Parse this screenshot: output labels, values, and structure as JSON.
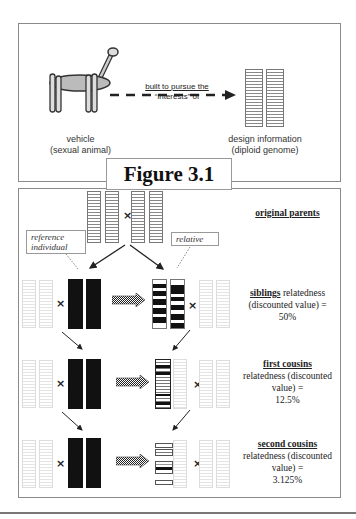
{
  "figure_title": "Figure 3.1",
  "top_panel": {
    "arrow_label_line1": "built to pursue the",
    "arrow_label_line2": "“interests” of",
    "vehicle_label_line1": "vehicle",
    "vehicle_label_line2": "(sexual animal)",
    "genome_label_line1": "design information",
    "genome_label_line2": "(diploid genome)"
  },
  "bottom_panel": {
    "cross_symbol": "×",
    "reference_label_line1": "reference",
    "reference_label_line2": "individual",
    "relative_label": "relative",
    "rows": [
      {
        "name": "original parents",
        "text": "",
        "value": ""
      },
      {
        "name": "siblings",
        "text": "relatedness (discounted value) =",
        "value": "50%"
      },
      {
        "name": "first cousins",
        "text": "relatedness (discounted value) =",
        "value": "12.5%"
      },
      {
        "name": "second cousins",
        "text": "relatedness (discounted value) =",
        "value": "3.125%"
      }
    ]
  }
}
